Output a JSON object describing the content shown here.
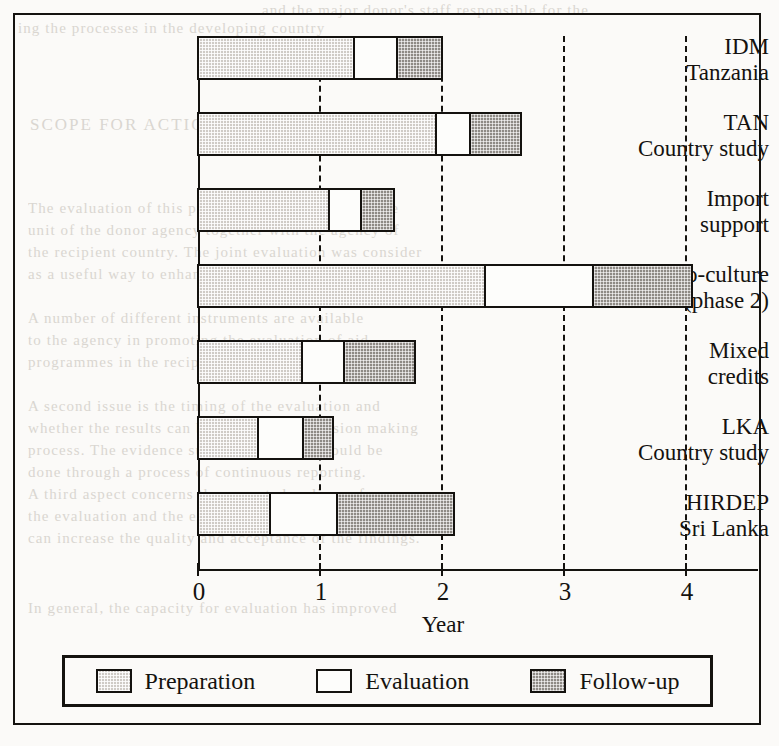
{
  "chart_data": {
    "type": "bar",
    "subtype": "stacked-horizontal",
    "title": "",
    "xlabel": "Year",
    "ylabel": "",
    "xlim": [
      0,
      4.6
    ],
    "xticks": [
      0,
      1,
      2,
      3,
      4
    ],
    "xtick_labels": [
      "0",
      "1",
      "2",
      "3",
      "4"
    ],
    "grid": "vertical-dashed",
    "legend_position": "bottom",
    "categories": [
      "IDM Tanzania",
      "TAN Country study",
      "Import support",
      "Socio-culture (phase 2)",
      "Mixed credits",
      "LKA Country study",
      "HIRDEP Sri Lanka"
    ],
    "series": [
      {
        "name": "Preparation",
        "color": "#cfcbc6",
        "values": [
          1.28,
          1.95,
          1.07,
          2.35,
          0.85,
          0.49,
          0.59
        ]
      },
      {
        "name": "Evaluation",
        "color": "#ffffff",
        "values": [
          0.35,
          0.28,
          0.27,
          0.89,
          0.35,
          0.37,
          0.55
        ]
      },
      {
        "name": "Follow-up",
        "color": "#8e8a85",
        "values": [
          0.37,
          0.42,
          0.27,
          0.81,
          0.58,
          0.25,
          0.96
        ]
      }
    ],
    "totals": [
      2.0,
      2.65,
      1.61,
      4.05,
      1.78,
      1.11,
      2.1
    ]
  },
  "axis": {
    "x_title": "Year",
    "ticks": [
      {
        "label": "0",
        "value": 0
      },
      {
        "label": "1",
        "value": 1
      },
      {
        "label": "2",
        "value": 2
      },
      {
        "label": "3",
        "value": 3
      },
      {
        "label": "4",
        "value": 4
      }
    ]
  },
  "rows": [
    {
      "line1": "IDM",
      "line2": "Tanzania",
      "prep": 1.28,
      "eval": 0.35,
      "follow": 0.37
    },
    {
      "line1": "TAN",
      "line2": "Country study",
      "prep": 1.95,
      "eval": 0.28,
      "follow": 0.42
    },
    {
      "line1": "Import",
      "line2": "support",
      "prep": 1.07,
      "eval": 0.27,
      "follow": 0.27
    },
    {
      "line1": "Socio-culture",
      "line2": "(phase 2)",
      "prep": 2.35,
      "eval": 0.89,
      "follow": 0.81
    },
    {
      "line1": "Mixed",
      "line2": "credits",
      "prep": 0.85,
      "eval": 0.35,
      "follow": 0.58
    },
    {
      "line1": "LKA",
      "line2": "Country study",
      "prep": 0.49,
      "eval": 0.37,
      "follow": 0.25
    },
    {
      "line1": "HIRDEP",
      "line2": "Sri Lanka",
      "prep": 0.59,
      "eval": 0.55,
      "follow": 0.96
    }
  ],
  "legend": {
    "items": [
      {
        "label": "Preparation",
        "swatch": "preparation-swatch"
      },
      {
        "label": "Evaluation",
        "swatch": "evaluation-swatch"
      },
      {
        "label": "Follow-up",
        "swatch": "follow-up-swatch"
      }
    ]
  },
  "page_background_text": {
    "top_line_1": "and the major donor's staff responsible for the",
    "top_line_2": "ing the processes in the developing country",
    "heading": "SCOPE FOR ACTION",
    "body": [
      "The evaluation of this project was carried out by the",
      "unit of the donor agency together with the agency of",
      "the recipient country. The joint evaluation was consider",
      "as a useful way to enhance mutual learning.",
      "A number of different instruments are available",
      "to the agency in promoting the evaluation of aid",
      "programmes in the recipient countries.",
      "A second issue is the timing of the evaluation and",
      "whether the results can be fed into the decision making",
      "process. The evidence suggests that this should be",
      "done through a process of continuous reporting.",
      "A third aspect concerns the expected audience for",
      "the evaluation and the extent to which a joint approach",
      "can increase the quality and acceptance of the findings.",
      "In general, the capacity for evaluation has improved",
      "and the demands are likely to grow over the next few"
    ]
  },
  "colors": {
    "ink": "#14120f",
    "paper": "#fbfaf8",
    "preparation": "#cfcbc6",
    "evaluation": "#ffffff",
    "follow_up": "#8e8a85"
  }
}
